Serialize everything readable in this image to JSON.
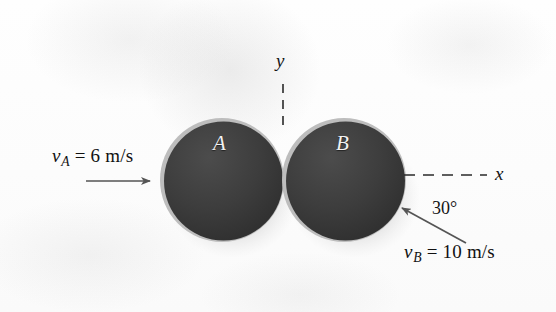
{
  "figure": {
    "type": "physics-diagram",
    "background_color": "#fdfdfd"
  },
  "spheres": [
    {
      "id": "A",
      "label": "A",
      "center_x": 222,
      "center_y": 180,
      "radius": 62,
      "fill_color": "#3a3a3a",
      "rim_color": "#b9b9b9",
      "label_color": "#f2f2f2"
    },
    {
      "id": "B",
      "label": "B",
      "center_x": 344,
      "center_y": 180,
      "radius": 62,
      "fill_color": "#3a3a3a",
      "rim_color": "#b9b9b9",
      "label_color": "#f2f2f2"
    }
  ],
  "axes": {
    "y_label": "y",
    "x_label": "x",
    "y_axis_x": 283,
    "y_axis_top": 84,
    "y_axis_bottom": 128,
    "x_axis_y": 175,
    "x_axis_left": 404,
    "x_axis_right": 487,
    "dash_color": "#2a2a2a"
  },
  "velocities": [
    {
      "id": "vA",
      "symbol": "v",
      "subscript": "A",
      "equals": "=",
      "magnitude": "6",
      "units": "m/s",
      "text": "vA = 6 m/s",
      "direction_deg": 0,
      "arrow_from_x": 86,
      "arrow_from_y": 181,
      "arrow_to_x": 152,
      "arrow_to_y": 181,
      "label_x": 52,
      "label_y": 147
    },
    {
      "id": "vB",
      "symbol": "v",
      "subscript": "B",
      "equals": "=",
      "magnitude": "10",
      "units": "m/s",
      "text": "vB = 10 m/s",
      "direction_deg": 210,
      "arrow_from_x": 466,
      "arrow_from_y": 243,
      "arrow_to_x": 400,
      "arrow_to_y": 207,
      "label_x": 404,
      "label_y": 243
    }
  ],
  "angle": {
    "value": "30",
    "unit": "°",
    "text": "30°",
    "label_x": 434,
    "label_y": 200
  },
  "colors": {
    "sphere_fill": "#3a3a3a",
    "sphere_rim": "#b9b9b9",
    "shadow": "#cfcfcf",
    "ink": "#111111",
    "arrow": "#555555"
  }
}
